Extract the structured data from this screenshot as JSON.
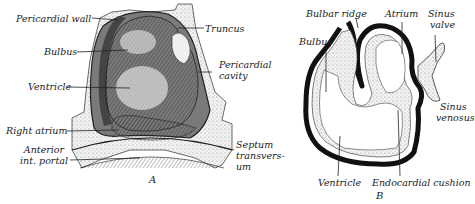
{
  "figure_a": {
    "caption": "A",
    "labels": {
      "pericardial_wall": "Pericardial wall",
      "truncus": "Truncus",
      "bulbus": "Bulbus",
      "pericardial_cavity_1": "Pericardial",
      "pericardial_cavity_2": "cavity",
      "ventricle": "Ventricle",
      "right_atrium": "Right atrium",
      "anterior_portal_1": "Anterior",
      "anterior_portal_2": "int. portal",
      "septum_1": "Septum",
      "septum_2": "transvers-",
      "septum_3": "um"
    }
  },
  "figure_b": {
    "caption": "B",
    "labels": {
      "bulbar_ridge": "Bulbar ridge",
      "atrium": "Atrium",
      "sinus_valve_1": "Sinus",
      "sinus_valve_2": "valve",
      "bulbus": "Bulbus",
      "sinus_venosus_1": "Sinus",
      "sinus_venosus_2": "venosus",
      "ventricle": "Ventricle",
      "endocardial_cushion": "Endocardial cushion"
    }
  },
  "colors": {
    "ink": "#1a1a1a",
    "stipple": "#d8d8d8",
    "shade": "#6a6a6a",
    "background": "#ffffff"
  }
}
